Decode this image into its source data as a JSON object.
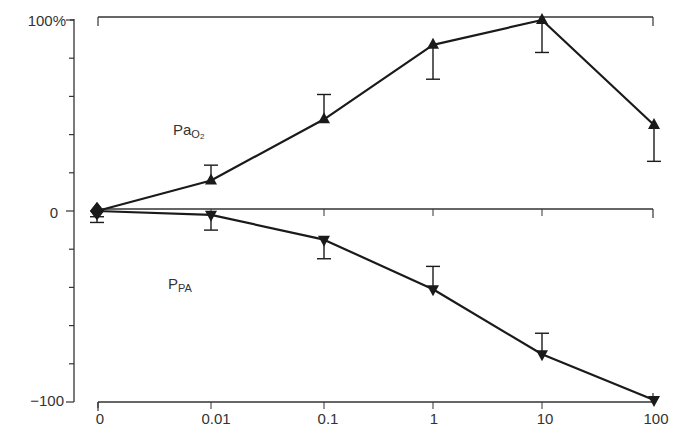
{
  "chart_data": {
    "type": "line",
    "title": "",
    "xlabel": "",
    "ylabel": "",
    "x": [
      "0",
      "0.01",
      "0.1",
      "1",
      "10",
      "100"
    ],
    "x_scale": "log (with 0 as first category)",
    "ylim": [
      -100,
      100
    ],
    "y_ticks": [
      {
        "value": 100,
        "label": "100%"
      },
      {
        "value": 0,
        "label": "0"
      },
      {
        "value": -100,
        "label": "−100"
      }
    ],
    "y_minor_tick_step": 20,
    "grid": false,
    "reference_lines": [
      100,
      0,
      -100
    ],
    "series": [
      {
        "name": "PaO2",
        "label_main": "Pa",
        "label_sub": "O",
        "label_sub2": "2",
        "marker": "triangle-up",
        "values": [
          0,
          16,
          48,
          87,
          100,
          45
        ],
        "error": [
          {
            "dir": "down",
            "size": 3
          },
          {
            "dir": "up",
            "size": 8
          },
          {
            "dir": "up",
            "size": 13
          },
          {
            "dir": "down",
            "size": 18
          },
          {
            "dir": "down",
            "size": 17
          },
          {
            "dir": "down",
            "size": 19
          }
        ]
      },
      {
        "name": "PPA",
        "label_main": "P",
        "label_sub": "PA",
        "label_sub2": "",
        "marker": "triangle-down",
        "values": [
          0,
          -2,
          -15,
          -41,
          -75,
          -99
        ],
        "error": [
          {
            "dir": "down",
            "size": 6
          },
          {
            "dir": "down",
            "size": 8
          },
          {
            "dir": "down",
            "size": 10
          },
          {
            "dir": "up",
            "size": 12
          },
          {
            "dir": "up",
            "size": 11
          },
          {
            "dir": "none",
            "size": 0
          }
        ]
      }
    ],
    "annotations": [
      {
        "text": "PaO2",
        "near_series": "PaO2",
        "position": "upper-left"
      },
      {
        "text": "PPA",
        "near_series": "PPA",
        "position": "lower-left"
      }
    ]
  },
  "axis": {
    "y_labels": {
      "top": "100%",
      "mid": "0",
      "bottom": "−100"
    },
    "x_labels": [
      "0",
      "0.01",
      "0.1",
      "1",
      "10",
      "100"
    ]
  },
  "labels": {
    "pao2_main": "Pa",
    "pao2_sub": "O",
    "pao2_sub2": "2",
    "ppa_main": "P",
    "ppa_sub": "PA"
  },
  "colors": {
    "line": "#1a1a1a",
    "axis": "#333333",
    "text": "#333333",
    "background": "#ffffff"
  }
}
